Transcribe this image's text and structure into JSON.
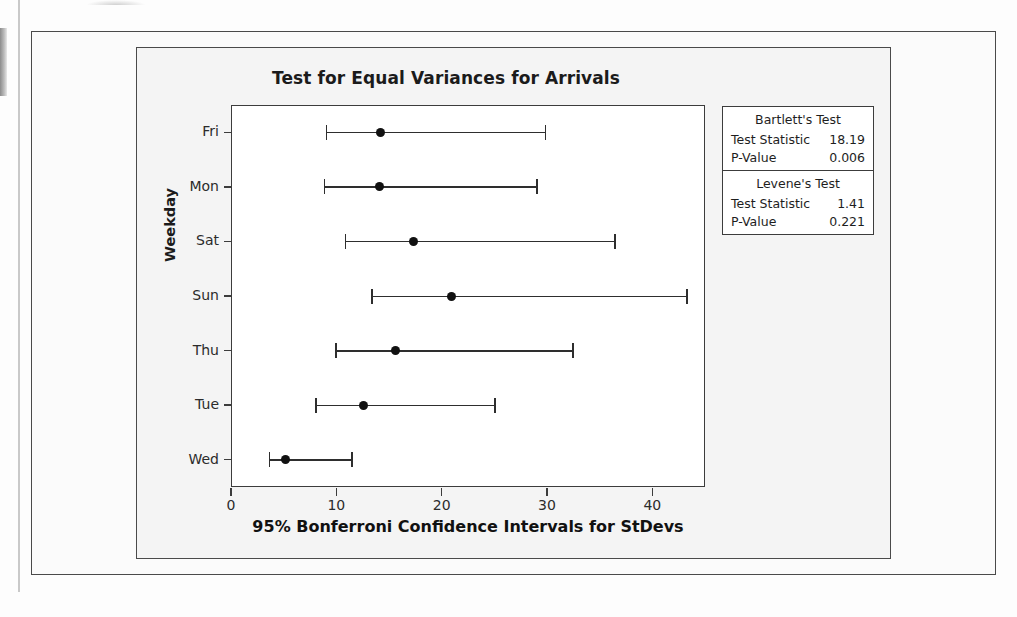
{
  "chart_data": {
    "type": "interval",
    "title": "Test for Equal Variances for Arrivals",
    "xlabel": "95% Bonferroni Confidence Intervals for StDevs",
    "ylabel": "Weekday",
    "xlim": [
      0,
      45
    ],
    "xticks": [
      0,
      10,
      20,
      30,
      40
    ],
    "xtick_labels": [
      "0",
      "10",
      "20",
      "30",
      "40"
    ],
    "grid": false,
    "legend": "none",
    "categories": [
      "Fri",
      "Mon",
      "Sat",
      "Sun",
      "Thu",
      "Tue",
      "Wed"
    ],
    "points": [
      {
        "category": "Fri",
        "lower": 9.0,
        "center": 14.2,
        "upper": 29.8
      },
      {
        "category": "Mon",
        "lower": 8.8,
        "center": 14.1,
        "upper": 29.0
      },
      {
        "category": "Sat",
        "lower": 10.8,
        "center": 17.3,
        "upper": 36.4
      },
      {
        "category": "Sun",
        "lower": 13.3,
        "center": 20.9,
        "upper": 43.2
      },
      {
        "category": "Thu",
        "lower": 9.9,
        "center": 15.6,
        "upper": 32.4
      },
      {
        "category": "Tue",
        "lower": 8.0,
        "center": 12.6,
        "upper": 25.0
      },
      {
        "category": "Wed",
        "lower": 3.6,
        "center": 5.2,
        "upper": 11.4
      }
    ]
  },
  "stats_table": {
    "blocks": [
      {
        "heading": "Bartlett's Test",
        "rows": [
          {
            "label": "Test Statistic",
            "value": "18.19"
          },
          {
            "label": "P-Value",
            "value": "0.006"
          }
        ]
      },
      {
        "heading": "Levene's Test",
        "rows": [
          {
            "label": "Test Statistic",
            "value": "1.41"
          },
          {
            "label": "P-Value",
            "value": "0.221"
          }
        ]
      }
    ]
  },
  "colors": {
    "marker": "#111111",
    "line": "#2e2e2e",
    "axis": "#3c3c3c",
    "frame": "#4a4a4a",
    "plot_background": "#ffffff",
    "page_background": "#fdfdfd"
  }
}
